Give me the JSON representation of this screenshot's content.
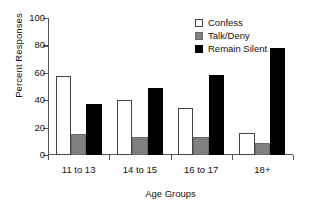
{
  "chart_data": {
    "type": "bar",
    "title": "",
    "xlabel": "Age Groups",
    "ylabel": "Percent Responses",
    "categories": [
      "11 to 13",
      "14 to 15",
      "16 to 17",
      "18+"
    ],
    "series": [
      {
        "name": "Confess",
        "key": "confess",
        "color": "#ffffff",
        "values": [
          58,
          40,
          34,
          16
        ]
      },
      {
        "name": "Talk/Deny",
        "key": "talkdeny",
        "color": "#808080",
        "values": [
          15,
          13.5,
          13,
          8.5
        ]
      },
      {
        "name": "Remain Silent",
        "key": "silent",
        "color": "#000000",
        "values": [
          37,
          49,
          58.5,
          78
        ]
      }
    ],
    "ylim": [
      0,
      100
    ],
    "yticks": [
      0,
      20,
      40,
      60,
      80,
      100
    ],
    "ytick_labels": [
      "0",
      "20",
      "40",
      "60",
      "80",
      "100"
    ],
    "grid": false,
    "legend_position": "top-right"
  }
}
